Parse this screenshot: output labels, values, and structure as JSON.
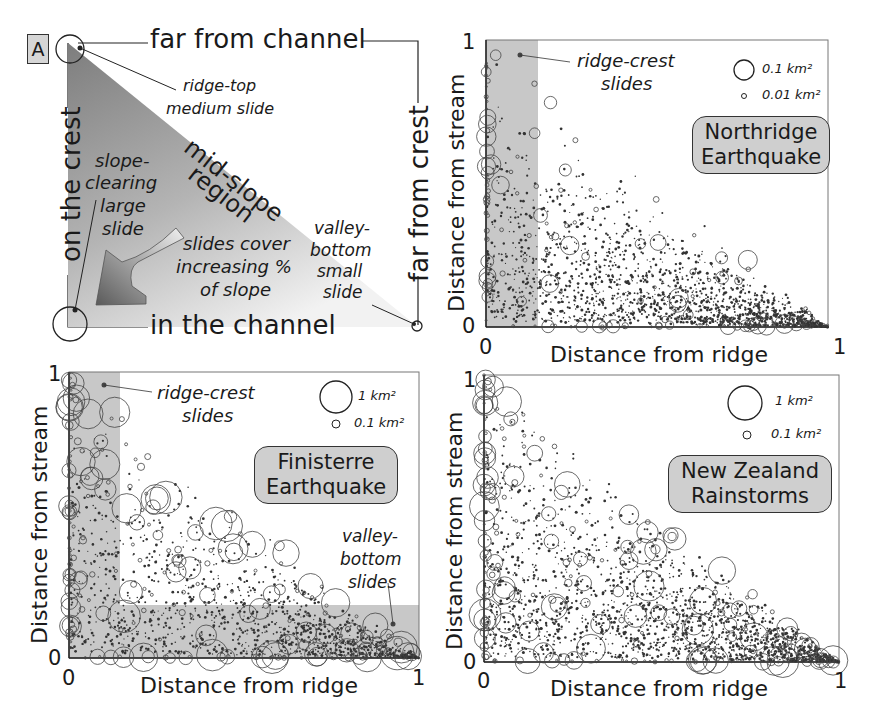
{
  "panel_a": {
    "tag": "A",
    "top_label": "far from channel",
    "bottom_label": "in the channel",
    "left_label": "on the crest",
    "right_label": "far from crest",
    "ridge_top": [
      "ridge-top",
      "medium slide"
    ],
    "mid_slope": [
      "mid-slope",
      "region"
    ],
    "slope_clearing": [
      "slope-",
      "clearing",
      "large",
      "slide"
    ],
    "cover": [
      "slides cover",
      "increasing %",
      "of slope"
    ],
    "valley_bottom": [
      "valley-",
      "bottom",
      "small",
      "slide"
    ]
  },
  "axes": {
    "xlabel": "Distance from ridge",
    "ylabel": "Distance from stream",
    "tick0": "0",
    "tick1": "1"
  },
  "panels": {
    "northridge": {
      "title": [
        "Northridge",
        "Earthquake"
      ],
      "legend_large": "0.1 km²",
      "legend_small": "0.01 km²",
      "annotation": [
        "ridge-crest",
        "slides"
      ]
    },
    "finisterre": {
      "title": [
        "Finisterre",
        "Earthquake"
      ],
      "legend_large": "1 km²",
      "legend_small": "0.1 km²",
      "annotation": [
        "ridge-crest",
        "slides"
      ],
      "annotation2": [
        "valley-",
        "bottom",
        "slides"
      ]
    },
    "newzealand": {
      "title": [
        "New Zealand",
        "Rainstorms"
      ],
      "legend_large": "1 km²",
      "legend_small": "0.1 km²"
    }
  },
  "colors": {
    "shade": "#c8c8c8",
    "triangle_dark": "#8a8a8a",
    "triangle_light": "#f0f0f0",
    "points": "#333333"
  },
  "chart_data": [
    {
      "type": "diagram",
      "title": "A",
      "description": "Conceptual triangle of hillslope position: x = distance from ridge, y = distance from stream",
      "annotations": [
        "far from channel",
        "in the channel",
        "on the crest",
        "far from crest",
        "ridge-top medium slide",
        "mid-slope region",
        "slope-clearing large slide",
        "slides cover increasing % of slope",
        "valley-bottom small slide"
      ]
    },
    {
      "type": "scatter",
      "title": "Northridge Earthquake",
      "xlabel": "Distance from ridge",
      "ylabel": "Distance from stream",
      "xlim": [
        0,
        1
      ],
      "ylim": [
        0,
        1
      ],
      "legend": [
        "0.1 km²",
        "0.01 km²"
      ],
      "shaded_regions": [
        {
          "name": "ridge-crest slides",
          "x": [
            0,
            0.15
          ],
          "y": [
            0,
            1
          ]
        }
      ],
      "note": "Points fill triangle x + y <= 1; density highest near the hypotenuse and along x=0"
    },
    {
      "type": "scatter",
      "title": "Finisterre Earthquake",
      "xlabel": "Distance from ridge",
      "ylabel": "Distance from stream",
      "xlim": [
        0,
        1
      ],
      "ylim": [
        0,
        1
      ],
      "legend": [
        "1 km²",
        "0.1 km²"
      ],
      "shaded_regions": [
        {
          "name": "ridge-crest slides",
          "x": [
            0,
            0.15
          ],
          "y": [
            0,
            1
          ]
        },
        {
          "name": "valley-bottom slides",
          "x": [
            0,
            1
          ],
          "y": [
            0,
            0.18
          ]
        }
      ],
      "note": "Large slides concentrated near x=0 and y=0"
    },
    {
      "type": "scatter",
      "title": "New Zealand Rainstorms",
      "xlabel": "Distance from ridge",
      "ylabel": "Distance from stream",
      "xlim": [
        0,
        1
      ],
      "ylim": [
        0,
        1
      ],
      "legend": [
        "1 km²",
        "0.1 km²"
      ],
      "note": "Points fill triangle x + y <= 1; large slides near the origin"
    }
  ]
}
